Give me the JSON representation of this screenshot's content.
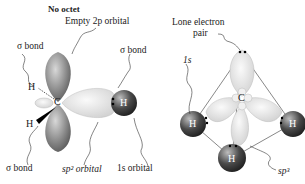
{
  "left_diagram": {
    "title": "No octet",
    "labels": {
      "empty_2p": "Empty 2p orbital",
      "sigma_top_left": "σ bond",
      "sigma_top_right": "σ bond",
      "sigma_bottom": "σ bond",
      "sp2": "sp² orbital",
      "one_s": "1s orbital"
    },
    "atoms": {
      "carbon": "C",
      "h1": "H",
      "h2": "H",
      "h3": "H"
    }
  },
  "right_diagram": {
    "labels": {
      "lone_pair_line1": "Lone electron",
      "lone_pair_line2": "pair",
      "one_s": "1s",
      "sp3": "sp³"
    },
    "atoms": {
      "carbon": "C",
      "h1": "H",
      "h2": "H",
      "h3": "H"
    }
  },
  "colors": {
    "p_lobe": "#8a8a8a",
    "hybrid_lobe": "#e8e8e8",
    "h_atom_dark": "#3a3a3a",
    "h_atom_light": "#9a9a9a"
  }
}
